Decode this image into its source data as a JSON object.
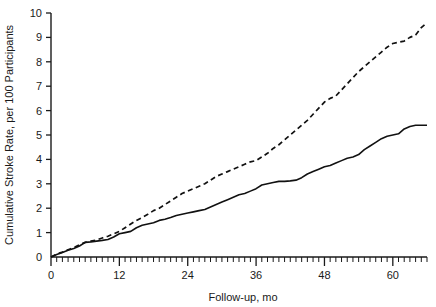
{
  "chart_data": {
    "type": "line",
    "title": "",
    "xlabel": "Follow-up, mo",
    "ylabel": "Cumulative Stroke Rate, per 100 Participants",
    "xlim": [
      0,
      66
    ],
    "ylim": [
      0,
      10
    ],
    "grid": false,
    "legend": "none",
    "x_ticks_major": [
      0,
      12,
      24,
      36,
      48,
      60
    ],
    "x_tick_labels": [
      "0",
      "12",
      "24",
      "36",
      "48",
      "60"
    ],
    "x_minor_tick_interval": 1,
    "y_ticks": [
      0,
      1,
      2,
      3,
      4,
      5,
      6,
      7,
      8,
      9,
      10
    ],
    "y_tick_labels": [
      "0",
      "1",
      "2",
      "3",
      "4",
      "5",
      "6",
      "7",
      "8",
      "9",
      "10"
    ],
    "series": [
      {
        "name": "dashed-upper-curve",
        "style": "dashed",
        "x": [
          0,
          1,
          2,
          3,
          4,
          5,
          6,
          7,
          8,
          9,
          10,
          11,
          12,
          13,
          14,
          15,
          16,
          17,
          18,
          19,
          20,
          21,
          22,
          23,
          24,
          25,
          26,
          27,
          28,
          29,
          30,
          31,
          32,
          33,
          34,
          35,
          36,
          37,
          38,
          39,
          40,
          41,
          42,
          43,
          44,
          45,
          46,
          47,
          48,
          49,
          50,
          51,
          52,
          53,
          54,
          55,
          56,
          57,
          58,
          59,
          60,
          61,
          62,
          63,
          64,
          65,
          66
        ],
        "y": [
          0.0,
          0.12,
          0.2,
          0.3,
          0.38,
          0.5,
          0.6,
          0.65,
          0.7,
          0.78,
          0.85,
          0.95,
          1.05,
          1.2,
          1.35,
          1.5,
          1.62,
          1.75,
          1.9,
          2.0,
          2.15,
          2.3,
          2.45,
          2.6,
          2.7,
          2.8,
          2.9,
          3.0,
          3.15,
          3.3,
          3.4,
          3.5,
          3.6,
          3.7,
          3.8,
          3.9,
          3.95,
          4.1,
          4.25,
          4.45,
          4.6,
          4.8,
          5.0,
          5.2,
          5.4,
          5.6,
          5.85,
          6.1,
          6.35,
          6.5,
          6.6,
          6.85,
          7.1,
          7.35,
          7.6,
          7.8,
          8.0,
          8.2,
          8.4,
          8.6,
          8.75,
          8.8,
          8.85,
          9.0,
          9.1,
          9.4,
          9.6
        ]
      },
      {
        "name": "solid-lower-curve",
        "style": "solid",
        "x": [
          0,
          1,
          2,
          3,
          4,
          5,
          6,
          7,
          8,
          9,
          10,
          11,
          12,
          13,
          14,
          15,
          16,
          17,
          18,
          19,
          20,
          21,
          22,
          23,
          24,
          25,
          26,
          27,
          28,
          29,
          30,
          31,
          32,
          33,
          34,
          35,
          36,
          37,
          38,
          39,
          40,
          41,
          42,
          43,
          44,
          45,
          46,
          47,
          48,
          49,
          50,
          51,
          52,
          53,
          54,
          55,
          56,
          57,
          58,
          59,
          60,
          61,
          62,
          63,
          64,
          65,
          66
        ],
        "y": [
          0.0,
          0.1,
          0.18,
          0.28,
          0.35,
          0.45,
          0.6,
          0.62,
          0.65,
          0.68,
          0.72,
          0.82,
          0.95,
          1.0,
          1.05,
          1.2,
          1.3,
          1.35,
          1.4,
          1.5,
          1.55,
          1.62,
          1.7,
          1.75,
          1.8,
          1.85,
          1.9,
          1.95,
          2.05,
          2.15,
          2.25,
          2.35,
          2.45,
          2.55,
          2.6,
          2.7,
          2.8,
          2.95,
          3.0,
          3.05,
          3.1,
          3.1,
          3.12,
          3.15,
          3.25,
          3.4,
          3.5,
          3.6,
          3.7,
          3.75,
          3.85,
          3.95,
          4.05,
          4.1,
          4.2,
          4.4,
          4.55,
          4.7,
          4.85,
          4.95,
          5.0,
          5.05,
          5.25,
          5.35,
          5.4,
          5.4,
          5.4
        ]
      }
    ]
  }
}
